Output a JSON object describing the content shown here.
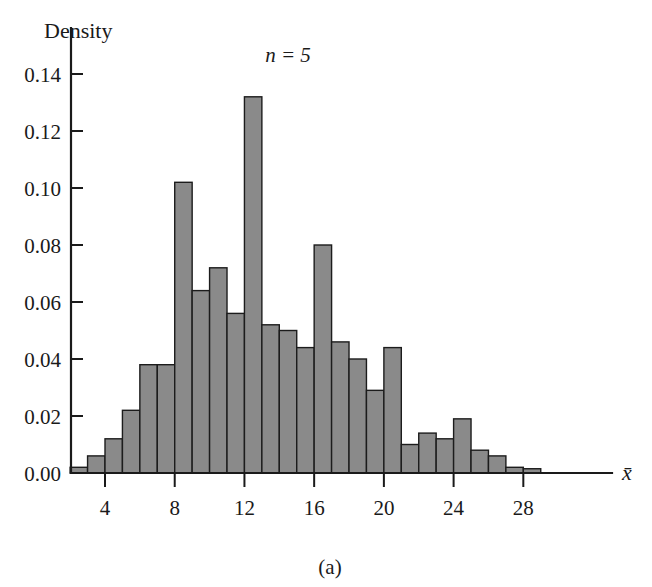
{
  "figure": {
    "caption": "(a)",
    "annotation": "n = 5",
    "y_axis_title": "Density",
    "x_axis_title": "x̄"
  },
  "chart_data": {
    "type": "bar",
    "title": "",
    "subtitle": "n = 5",
    "xlabel": "x̄",
    "ylabel": "Density",
    "grid": false,
    "legend": "none",
    "bin_width": 1,
    "xlim": [
      1,
      30
    ],
    "ylim": [
      0.0,
      0.145
    ],
    "x_ticks": [
      4,
      8,
      12,
      16,
      20,
      24,
      28
    ],
    "x_tick_labels": [
      "4",
      "8",
      "12",
      "16",
      "20",
      "24",
      "28"
    ],
    "y_ticks": [
      0.0,
      0.02,
      0.04,
      0.06,
      0.08,
      0.1,
      0.12,
      0.14
    ],
    "y_tick_labels": [
      "0.00",
      "0.02",
      "0.04",
      "0.06",
      "0.08",
      "0.10",
      "0.12",
      "0.14"
    ],
    "bin_starts": [
      2,
      3,
      4,
      5,
      6,
      7,
      8,
      9,
      10,
      11,
      12,
      13,
      14,
      15,
      16,
      17,
      18,
      19,
      20,
      21,
      22,
      23,
      24,
      25,
      26,
      27,
      28
    ],
    "bin_ends": [
      3,
      4,
      5,
      6,
      7,
      8,
      9,
      10,
      11,
      12,
      13,
      14,
      15,
      16,
      17,
      18,
      19,
      20,
      21,
      22,
      23,
      24,
      25,
      26,
      27,
      28,
      29
    ],
    "bin_centers": [
      2.5,
      3.5,
      4.5,
      5.5,
      6.5,
      7.5,
      8.5,
      9.5,
      10.5,
      11.5,
      12.5,
      13.5,
      14.5,
      15.5,
      16.5,
      17.5,
      18.5,
      19.5,
      20.5,
      21.5,
      22.5,
      23.5,
      24.5,
      25.5,
      26.5,
      27.5,
      28.5
    ],
    "values": [
      0.002,
      0.006,
      0.012,
      0.022,
      0.038,
      0.038,
      0.102,
      0.064,
      0.072,
      0.056,
      0.132,
      0.052,
      0.05,
      0.044,
      0.08,
      0.046,
      0.04,
      0.029,
      0.044,
      0.01,
      0.014,
      0.012,
      0.019,
      0.008,
      0.006,
      0.002,
      0.0015
    ]
  }
}
